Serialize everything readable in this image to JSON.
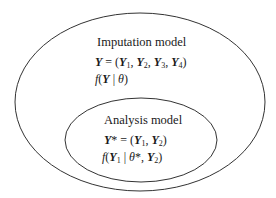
{
  "diagram": {
    "outer": {
      "title": "Imputation model",
      "line1": "Y = (Y1, Y2, Y3, Y4)",
      "line2": "f(Y | θ)",
      "stroke": "#333333"
    },
    "inner": {
      "title": "Analysis model",
      "line1": "Y* = (Y1, Y2)",
      "line2": "f(Y1 | θ*, Y2)",
      "stroke": "#333333"
    }
  }
}
